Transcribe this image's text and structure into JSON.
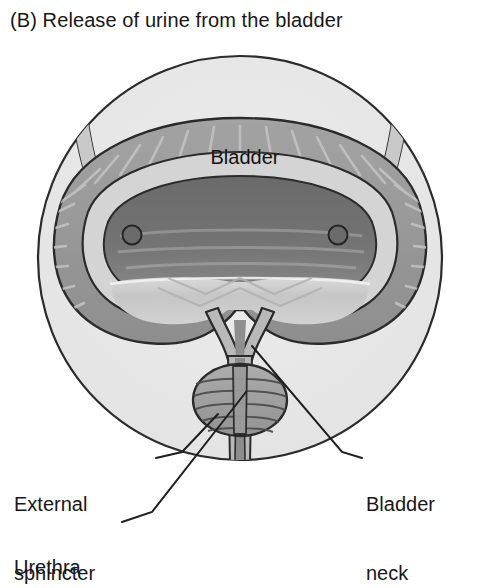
{
  "figure": {
    "panel_letter": "(B)",
    "title": "(B) Release of urine from the bladder",
    "caption_text": "Release of urine from the bladder",
    "state": "voiding"
  },
  "inner_labels": {
    "bladder": "Bladder"
  },
  "callouts": [
    {
      "id": "external-sphincter",
      "line1": "External",
      "line2": "sphincter",
      "text": "External sphincter",
      "side": "left"
    },
    {
      "id": "urethra",
      "line1": "Urethra",
      "line2": "",
      "text": "Urethra",
      "side": "left"
    },
    {
      "id": "bladder-neck",
      "line1": "Bladder",
      "line2": "neck",
      "text": "Bladder neck",
      "side": "right"
    }
  ],
  "anatomy_parts": [
    "circular-field",
    "bladder-wall",
    "bladder-mucosa",
    "bladder-lumen",
    "trigone",
    "ureter-left",
    "ureter-right",
    "ureteral-orifice-left",
    "ureteral-orifice-right",
    "bladder-neck-funnel",
    "urethra-channel",
    "external-sphincter-muscle"
  ],
  "colors": {
    "background": "#ffffff",
    "field_fill": "#e8e8e8",
    "outline": "#2b2b2b",
    "wall_fill": "#9a9a9a",
    "wall_fill_dark": "#8a8a8a",
    "mucosa_fill": "#cfcfcf",
    "lumen_fill": "#6e6e6e",
    "trigone_fill": "#c2c2c2",
    "sphincter_fill": "#9e9e9e",
    "urethra_fill": "#b5b5b5",
    "text": "#171717",
    "leader_line": "#1f1f1f"
  }
}
